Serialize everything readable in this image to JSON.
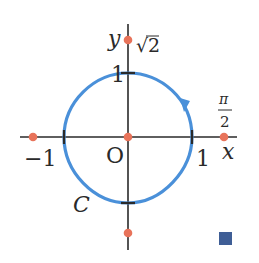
{
  "diagram": {
    "axes": {
      "x_label": "x",
      "y_label": "y",
      "origin_label": "O"
    },
    "tick_labels": {
      "x_pos": "1",
      "x_neg": "−1",
      "y_pos": "1"
    },
    "point_labels": {
      "sqrt2": "√2",
      "pi_over_2_num": "π",
      "pi_over_2_den": "2"
    },
    "curve_label": "C",
    "colors": {
      "curve": "#4a90d9",
      "points": "#e8735a",
      "axis": "#2a2a2a",
      "end_marker": "#3f5e96"
    }
  }
}
